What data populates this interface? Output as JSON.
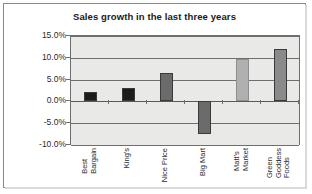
{
  "chart_data": {
    "type": "bar",
    "title": "Sales growth in the last three years",
    "xlabel": "",
    "ylabel": "",
    "categories": [
      "Best Bargain",
      "King's",
      "Nice Price",
      "Big Mart",
      "Matt's Market",
      "Green Goddess Foods"
    ],
    "category_lines": [
      [
        "Best",
        "Bargain"
      ],
      [
        "King's"
      ],
      [
        "Nice Price"
      ],
      [
        "Big Mart"
      ],
      [
        "Matt's",
        "Market"
      ],
      [
        "Green",
        "Goddess",
        "Foods"
      ]
    ],
    "values": [
      2.2,
      3.0,
      6.5,
      -7.5,
      9.7,
      12.0
    ],
    "value_labels": [
      "2.2%",
      "3.0%",
      "6.5%",
      "-7.5%",
      "9.7%",
      "12.0%"
    ],
    "bar_colors": [
      "#1c1c1c",
      "#1c1c1c",
      "#6b6b6b",
      "#6b6b6b",
      "#b0b0b0",
      "#8a8a8a"
    ],
    "ylim": [
      -10.0,
      15.0
    ],
    "yticks": [
      15.0,
      10.0,
      5.0,
      0.0,
      -5.0,
      -10.0
    ],
    "ytick_labels": [
      "15.0%",
      "10.0%",
      "5.0%",
      "0.0%",
      "-5.0%",
      "-10.0%"
    ],
    "grid": true,
    "legend": false,
    "plot_background": "#e9e9e7",
    "axis_color": "#6e6e6e"
  }
}
